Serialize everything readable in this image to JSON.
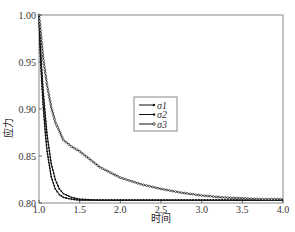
{
  "chart_data": {
    "type": "line",
    "title": "",
    "xlabel": "时间",
    "ylabel": "应力",
    "xlim": [
      1.0,
      4.0
    ],
    "ylim": [
      0.8,
      1.0
    ],
    "xticks": [
      1.0,
      1.5,
      2.0,
      2.5,
      3.0,
      3.5,
      4.0
    ],
    "xtick_labels": [
      "1.0",
      "1.5",
      "2.0",
      "2.5",
      "3.0",
      "3.5",
      "4.0"
    ],
    "yticks": [
      0.8,
      0.85,
      0.9,
      0.95,
      1.0
    ],
    "ytick_labels": [
      "0.80",
      "0.85",
      "0.90",
      "0.95",
      "1.00"
    ],
    "grid": false,
    "legend_position": "center",
    "series": [
      {
        "name": "σ1",
        "marker": "dot",
        "x": [
          1.0,
          1.02,
          1.05,
          1.08,
          1.1,
          1.15,
          1.2,
          1.25,
          1.3,
          1.4,
          1.5,
          1.75,
          2.0,
          2.5,
          3.0,
          3.5,
          4.0
        ],
        "values": [
          1.0,
          0.95,
          0.905,
          0.872,
          0.855,
          0.828,
          0.815,
          0.809,
          0.806,
          0.804,
          0.803,
          0.803,
          0.803,
          0.803,
          0.803,
          0.803,
          0.803
        ]
      },
      {
        "name": "σ2",
        "marker": "dot",
        "x": [
          1.0,
          1.02,
          1.05,
          1.08,
          1.1,
          1.15,
          1.2,
          1.25,
          1.3,
          1.4,
          1.5,
          1.75,
          2.0,
          2.5,
          3.0,
          3.5,
          4.0
        ],
        "values": [
          1.0,
          0.96,
          0.92,
          0.89,
          0.872,
          0.842,
          0.825,
          0.815,
          0.81,
          0.806,
          0.804,
          0.803,
          0.803,
          0.803,
          0.803,
          0.803,
          0.803
        ]
      },
      {
        "name": "σ3",
        "marker": "circle",
        "x": [
          1.0,
          1.05,
          1.1,
          1.15,
          1.2,
          1.3,
          1.4,
          1.5,
          1.75,
          2.0,
          2.25,
          2.5,
          2.75,
          3.0,
          3.25,
          3.5,
          3.75,
          4.0
        ],
        "values": [
          1.0,
          0.955,
          0.925,
          0.902,
          0.886,
          0.867,
          0.86,
          0.855,
          0.838,
          0.827,
          0.82,
          0.815,
          0.811,
          0.808,
          0.806,
          0.805,
          0.804,
          0.804
        ]
      }
    ]
  }
}
